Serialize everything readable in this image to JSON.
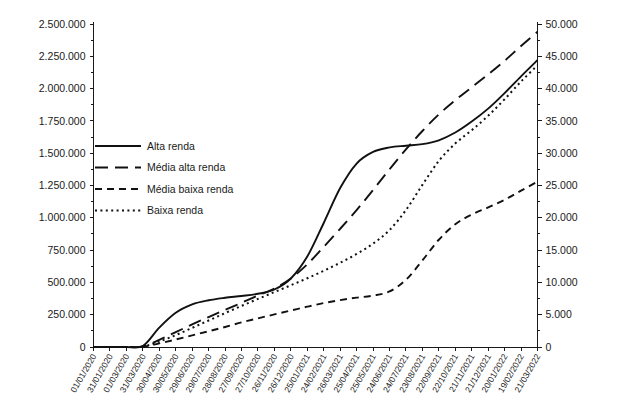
{
  "chart_data": {
    "type": "line",
    "title": "",
    "subtitle": "",
    "xlabel": "",
    "ylabel": "",
    "y2label": "",
    "grid": false,
    "legend_position": "upper-left-inside",
    "ylim": [
      0,
      2500000
    ],
    "y2lim": [
      0,
      50000
    ],
    "y_ticks": [
      "0",
      "250.000",
      "500.000",
      "750.000",
      "1.000.000",
      "1.250.000",
      "1.500.000",
      "1.750.000",
      "2.000.000",
      "2.250.000",
      "2.500.000"
    ],
    "y2_ticks": [
      "0",
      "5.000",
      "10.000",
      "15.000",
      "20.000",
      "25.000",
      "30.000",
      "35.000",
      "40.000",
      "45.000",
      "50.000"
    ],
    "x": [
      "01/01/2020",
      "31/01/2020",
      "01/03/2020",
      "31/03/2020",
      "30/04/2020",
      "30/05/2020",
      "29/06/2020",
      "29/07/2020",
      "28/08/2020",
      "27/09/2020",
      "27/10/2020",
      "26/11/2020",
      "26/12/2020",
      "25/01/2021",
      "24/02/2021",
      "26/03/2021",
      "25/04/2021",
      "25/05/2021",
      "24/06/2021",
      "24/07/2021",
      "23/08/2021",
      "22/09/2021",
      "22/10/2021",
      "21/11/2021",
      "21/12/2021",
      "20/01/2022",
      "19/02/2022",
      "21/03/2022"
    ],
    "series": [
      {
        "name": "Alta renda",
        "style": "solid",
        "axis": "left",
        "values": [
          0,
          0,
          0,
          8000,
          150000,
          265000,
          330000,
          362000,
          381000,
          395000,
          412000,
          445000,
          530000,
          700000,
          960000,
          1230000,
          1420000,
          1510000,
          1545000,
          1558000,
          1570000,
          1600000,
          1660000,
          1745000,
          1845000,
          1965000,
          2095000,
          2220000
        ]
      },
      {
        "name": "Média alta renda",
        "style": "long-dash",
        "axis": "left",
        "values": [
          0,
          0,
          0,
          4000,
          55000,
          115000,
          175000,
          232000,
          288000,
          342000,
          398000,
          452000,
          530000,
          640000,
          775000,
          915000,
          1060000,
          1215000,
          1375000,
          1530000,
          1672000,
          1800000,
          1910000,
          2010000,
          2110000,
          2215000,
          2330000,
          2440000
        ]
      },
      {
        "name": "Média baixa renda",
        "style": "dash",
        "axis": "left",
        "values": [
          0,
          0,
          0,
          2000,
          28000,
          58000,
          90000,
          122000,
          155000,
          190000,
          222000,
          252000,
          282000,
          312000,
          340000,
          363000,
          382000,
          398000,
          430000,
          520000,
          670000,
          830000,
          950000,
          1025000,
          1080000,
          1140000,
          1210000,
          1280000
        ]
      },
      {
        "name": "Baixa renda",
        "style": "dot",
        "axis": "left",
        "values": [
          0,
          0,
          0,
          3000,
          42000,
          92000,
          148000,
          205000,
          262000,
          318000,
          372000,
          425000,
          478000,
          532000,
          590000,
          652000,
          720000,
          800000,
          905000,
          1060000,
          1255000,
          1440000,
          1575000,
          1678000,
          1790000,
          1918000,
          2055000,
          2180000
        ]
      }
    ]
  },
  "legend": {
    "items": [
      {
        "label": "Alta renda"
      },
      {
        "label": "Média alta renda"
      },
      {
        "label": "Média baixa renda"
      },
      {
        "label": "Baixa renda"
      }
    ]
  },
  "colors": {
    "ink": "#111111",
    "axis": "#1a1a1a",
    "background": "#ffffff"
  }
}
